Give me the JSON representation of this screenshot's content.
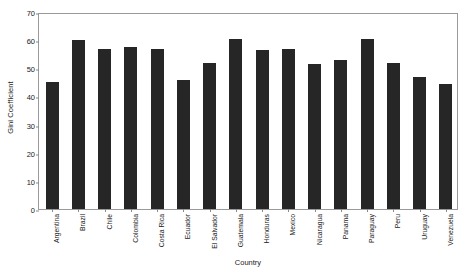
{
  "chart_data": {
    "type": "bar",
    "title": "",
    "xlabel": "Country",
    "ylabel": "Gini Coefficient",
    "ylim": [
      0,
      70
    ],
    "yticks": [
      0,
      10,
      20,
      30,
      40,
      50,
      60,
      70
    ],
    "grid": false,
    "legend": null,
    "bar_color": "#262626",
    "categories": [
      "Argentina",
      "Brazil",
      "Chile",
      "Colombia",
      "Costa Rica",
      "Ecuador",
      "El Salvador",
      "Guatemala",
      "Honduras",
      "Mexico",
      "Nicaragua",
      "Panama",
      "Paraguay",
      "Peru",
      "Uruguay",
      "Venezuela"
    ],
    "values": [
      45,
      60,
      57,
      57.5,
      57,
      46,
      52,
      60.5,
      56.5,
      57,
      51.5,
      53,
      60.5,
      52,
      47,
      44.5
    ]
  }
}
